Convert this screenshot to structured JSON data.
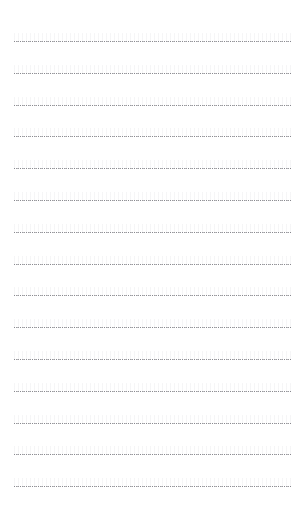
{
  "page": {
    "kind": "lined-paper",
    "label": "Dotted ruled writing paper",
    "width_px": 308,
    "height_px": 530,
    "background_color": "#ffffff"
  },
  "rules": {
    "count": 15,
    "first_line_y_px": 41,
    "line_spacing_px": 31.8,
    "last_line_y_px": 486,
    "left_margin_px": 14,
    "right_margin_px": 16,
    "line_color": "#9a9a9e",
    "ghost_color": "#f2f2f4",
    "style": "dotted",
    "dot_period_px": 2
  },
  "margins": {
    "top_label": "top margin",
    "bottom_label": "bottom margin",
    "top_height_px": 41,
    "bottom_height_px": 44
  },
  "content": {
    "text": "",
    "note": "blank page, no written content"
  }
}
